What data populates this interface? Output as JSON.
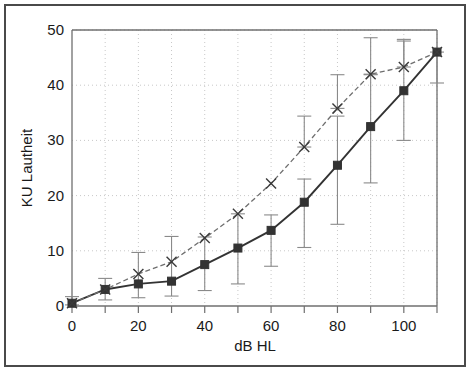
{
  "chart_data": {
    "type": "line",
    "title": "",
    "subtitle": "",
    "xlabel": "dB HL",
    "ylabel": "KU Lautheit",
    "xlim": [
      0,
      110
    ],
    "ylim": [
      0,
      50
    ],
    "xticks": [
      0,
      20,
      40,
      60,
      80,
      100
    ],
    "xticklabels": [
      "0",
      "20",
      "40",
      "60",
      "80",
      "100"
    ],
    "xminorticks": [
      10,
      30,
      50,
      70,
      90,
      110
    ],
    "yticks": [
      0,
      10,
      20,
      30,
      40,
      50
    ],
    "yticklabels": [
      "0",
      "10",
      "20",
      "30",
      "40",
      "50"
    ],
    "grid": true,
    "grid_style": "dotted",
    "legend": "none",
    "x": [
      0,
      10,
      20,
      30,
      40,
      50,
      60,
      70,
      80,
      90,
      100,
      110
    ],
    "series": [
      {
        "name": "solid-squares",
        "marker": "square",
        "linestyle": "solid",
        "color": "#333333",
        "values": [
          0.5,
          3.0,
          4.0,
          4.5,
          7.5,
          10.5,
          13.7,
          18.8,
          25.5,
          32.5,
          39.0,
          46.0
        ],
        "err_low": [
          0.3,
          1.9,
          2.5,
          2.7,
          4.7,
          6.5,
          6.5,
          8.2,
          10.7,
          10.2,
          9.0,
          5.6
        ],
        "err_high": [
          1.2,
          2.0,
          5.7,
          8.1,
          5.0,
          6.2,
          2.8,
          4.2,
          8.9,
          9.4,
          9.0,
          0.0
        ]
      },
      {
        "name": "dashed-crosses",
        "marker": "x",
        "linestyle": "dashed",
        "color": "#666666",
        "values": [
          0.5,
          3.0,
          5.8,
          8.0,
          12.3,
          16.7,
          22.2,
          28.8,
          35.8,
          42.0,
          43.3,
          46.0
        ],
        "err_low": [
          0.0,
          0.0,
          0.0,
          0.0,
          0.0,
          0.0,
          0.0,
          0.0,
          0.0,
          0.0,
          0.0,
          0.0
        ],
        "err_high": [
          0.0,
          0.0,
          0.0,
          0.0,
          0.0,
          0.0,
          0.0,
          5.6,
          6.1,
          6.6,
          5.0,
          0.0
        ]
      }
    ]
  },
  "axes": {
    "x_title": "dB HL",
    "y_title": "KU Lautheit"
  },
  "colors": {
    "frame": "#4a4a4a",
    "axis": "#6f6f6f",
    "grid": "#c8c8c8",
    "series_solid": "#333333",
    "series_dashed": "#6e6e6e",
    "errorbar": "#8a8a8a",
    "background": "#ffffff"
  }
}
